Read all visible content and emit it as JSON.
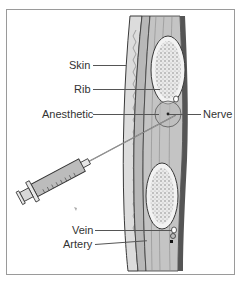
{
  "diagram": {
    "labels": {
      "skin": "Skin",
      "rib": "Rib",
      "anesthetic": "Anesthetic",
      "nerve": "Nerve",
      "vein": "Vein",
      "artery": "Artery"
    },
    "elements": {
      "syringe": "syringe-icon",
      "tissue_layers": "skin-muscle-cross-section",
      "upper_rib": "rib-cross-section",
      "lower_rib": "rib-cross-section",
      "anesthetic_bubble": "anesthetic-pool"
    },
    "colors": {
      "line": "#555555",
      "skin": "#d8d8d8",
      "muscle": "#a8a8a8",
      "bone": "#ececec",
      "outline": "#3a3a3a",
      "frame": "#9a9a9a"
    }
  }
}
